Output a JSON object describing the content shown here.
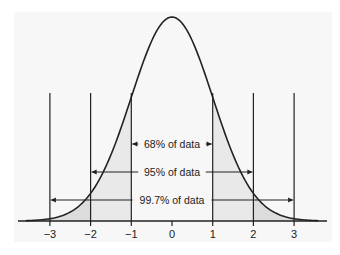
{
  "chart_data": {
    "type": "area",
    "title": "",
    "xlabel": "",
    "ylabel": "",
    "x_ticks": [
      -3,
      -2,
      -1,
      0,
      1,
      2,
      3
    ],
    "x_tick_labels": [
      "−3",
      "−2",
      "−1",
      "0",
      "1",
      "2",
      "3"
    ],
    "xlim": [
      -3.8,
      3.8
    ],
    "grid": false,
    "vertical_lines_at": [
      -3,
      -2,
      -1,
      1,
      2,
      3
    ],
    "ranges": [
      {
        "from": -1,
        "to": 1,
        "label": "68% of data",
        "percent": 68
      },
      {
        "from": -2,
        "to": 2,
        "label": "95% of data",
        "percent": 95
      },
      {
        "from": -3,
        "to": 3,
        "label": "99.7% of data",
        "percent": 99.7
      }
    ],
    "shaded_regions": [
      {
        "from": -2,
        "to": -1,
        "shade": "light"
      },
      {
        "from": 1,
        "to": 2,
        "shade": "light"
      },
      {
        "from": -3,
        "to": -2,
        "shade": "medium"
      },
      {
        "from": 2,
        "to": 3,
        "shade": "medium"
      }
    ],
    "colors": {
      "curve": "#222222",
      "background": "#f7f7f7",
      "shade_light": "#e9e9e9",
      "shade_medium": "#dcdcdc"
    }
  }
}
